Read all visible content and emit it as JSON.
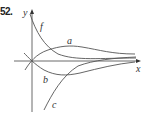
{
  "figure": {
    "problem_number": "52.",
    "axes": {
      "x_label": "x",
      "y_label": "y"
    },
    "curves": [
      {
        "name": "f",
        "label": "f",
        "description": "decreasing curve from top-left, approaching horizontal asymptote"
      },
      {
        "name": "a",
        "label": "a",
        "description": "rises through origin, peaks, then decays toward asymptote"
      },
      {
        "name": "b",
        "label": "b",
        "description": "falls through origin, reaches minimum, then rises toward asymptote"
      },
      {
        "name": "c",
        "label": "c",
        "description": "increasing curve from bottom, approaching horizontal asymptote"
      }
    ],
    "colors": {
      "curve": "#555555",
      "axis": "#444444",
      "text": "#333333"
    }
  }
}
